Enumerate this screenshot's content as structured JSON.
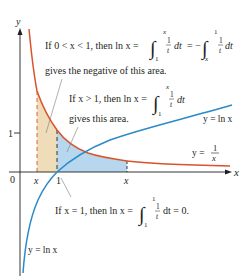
{
  "figure": {
    "axes": {
      "x_label": "x",
      "y_label": "y",
      "origin_label": "0",
      "x_tick_one": "1",
      "y_tick_one": "1",
      "x_small_label": "x",
      "x_large_label": "x"
    },
    "curves": {
      "reciprocal": {
        "label_y": "y =",
        "label_num": "1",
        "label_den": "x",
        "color": "#d9532b"
      },
      "log_right": {
        "label": "y = ln x",
        "color": "#2a8ac8"
      },
      "log_bottom": {
        "label": "y = ln x",
        "color": "#2a8ac8"
      }
    },
    "regions": {
      "tan_area_color": "#efdcb8",
      "blue_area_color": "#b6d7ee"
    },
    "annotations": {
      "a1": {
        "prefix": "If 0 < x < 1, then ln x =",
        "int1_upper": "x",
        "int1_lower": "1",
        "frac_num": "1",
        "frac_den": "t",
        "dt": "dt",
        "eq_minus": "= −",
        "int2_upper": "1",
        "int2_lower": "x",
        "frac2_num": "1",
        "frac2_den": "t",
        "dt2": "dt",
        "line2": "gives the negative of this area."
      },
      "a2": {
        "prefix": "If x > 1, then ln x =",
        "int_upper": "x",
        "int_lower": "1",
        "frac_num": "1",
        "frac_den": "t",
        "dt": "dt",
        "line2": "gives this area."
      },
      "a3": {
        "prefix": "If x = 1, then ln x =",
        "int_upper": "1",
        "int_lower": "1",
        "frac_num": "1",
        "frac_den": "t",
        "suffix": "dt = 0."
      }
    },
    "colors": {
      "axis": "#231f20",
      "reciprocal_curve": "#d9532b",
      "log_curve": "#2a8ac8",
      "tan_fill": "#efdcb8",
      "blue_fill": "#b6d7ee"
    }
  }
}
